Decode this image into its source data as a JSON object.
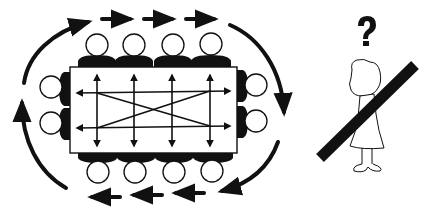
{
  "diagram": {
    "title": "",
    "left_panel": {
      "description": "Round-table meeting: people seated around a rectangular table, communication arrows across the table in all directions, and a circular flow of arrows around the group",
      "table": {
        "x": 70,
        "y": 67,
        "width": 167,
        "height": 86
      },
      "seats_top": 4,
      "seats_bottom": 4,
      "seats_left": 2,
      "seats_right": 2,
      "outer_flow": "clockwise"
    },
    "right_panel": {
      "description": "Single person standing alone, crossed out with a thick diagonal bar, with a question mark above",
      "symbol": "?"
    },
    "colors": {
      "ink": "#111111",
      "background": "#ffffff"
    }
  }
}
